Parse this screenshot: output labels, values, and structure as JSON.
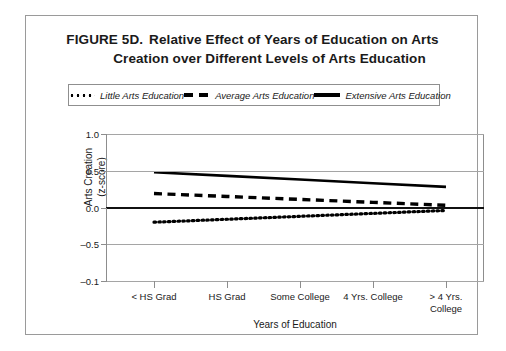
{
  "figure": {
    "label": "FIGURE 5D.",
    "title_line1": "Relative Effect of Years of Education on Arts",
    "title_line2": "Creation over Different Levels of Arts Education"
  },
  "chart_data": {
    "type": "line",
    "xlabel": "Years of Education",
    "ylabel": "Arts Creation (z-score)",
    "categories": [
      "< HS Grad",
      "HS Grad",
      "Some College",
      "4 Yrs. College",
      "> 4 Yrs. College"
    ],
    "ytick_labels": [
      "1.0",
      "0.5",
      "0.0",
      "-0.5",
      "-0.1"
    ],
    "ytick_values": [
      1.0,
      0.5,
      0.0,
      -0.5,
      -1.0
    ],
    "ylim": [
      -1.0,
      1.0
    ],
    "grid": true,
    "legend_position": "top",
    "zero_line": true,
    "series": [
      {
        "name": "Little Arts Education",
        "style": "dotted",
        "color": "#000000",
        "values": [
          -0.2,
          -0.16,
          -0.12,
          -0.08,
          -0.04
        ]
      },
      {
        "name": "Average Arts Education",
        "style": "dashed",
        "color": "#000000",
        "values": [
          0.19,
          0.15,
          0.11,
          0.07,
          0.03
        ]
      },
      {
        "name": "Extensive Arts Education",
        "style": "solid",
        "color": "#000000",
        "values": [
          0.48,
          0.43,
          0.38,
          0.33,
          0.28
        ]
      }
    ]
  }
}
